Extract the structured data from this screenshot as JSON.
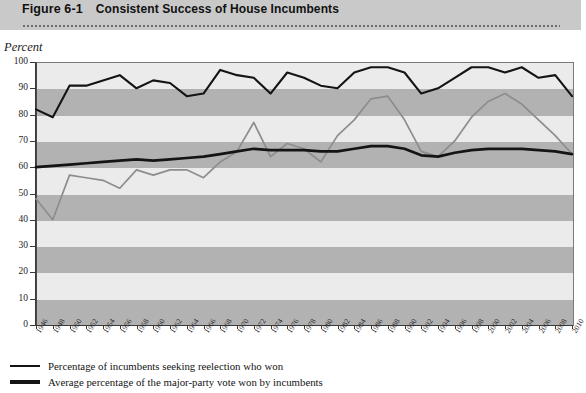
{
  "header": {
    "figure_number": "Figure 6-1",
    "title": "Consistent Success of House Incumbents"
  },
  "axis": {
    "y_axis_label": "Percent",
    "y_ticks": [
      "100",
      "90",
      "80",
      "70",
      "60",
      "50",
      "40",
      "30",
      "20",
      "10",
      "0"
    ]
  },
  "legend": {
    "items": [
      {
        "label": "Percentage of incumbents seeking reelection who won",
        "style": "thin",
        "color": "#141414"
      },
      {
        "label": "Average percentage of the major-party vote won by incumbents",
        "style": "thick",
        "color": "#141414"
      }
    ]
  },
  "chart_data": {
    "type": "line",
    "title": "Consistent Success of House Incumbents",
    "xlabel": "",
    "ylabel": "Percent",
    "ylim": [
      0,
      100
    ],
    "xlim": [
      1946,
      2010
    ],
    "grid": "horizontal alternating shaded bands every 10 percent",
    "legend_position": "below plot, left aligned",
    "categories": [
      "1946",
      "1948",
      "1950",
      "1952",
      "1954",
      "1956",
      "1958",
      "1960",
      "1962",
      "1964",
      "1966",
      "1968",
      "1970",
      "1972",
      "1974",
      "1976",
      "1978",
      "1980",
      "1982",
      "1984",
      "1986",
      "1988",
      "1990",
      "1992",
      "1994",
      "1996",
      "1998",
      "2000",
      "2002",
      "2004",
      "2006",
      "2008",
      "2010"
    ],
    "series": [
      {
        "name": "Percentage of incumbents seeking reelection who won",
        "color": "#141414",
        "values": [
          82,
          79,
          91,
          91,
          93,
          95,
          90,
          93,
          92,
          87,
          88,
          97,
          95,
          94,
          88,
          96,
          94,
          91,
          90,
          96,
          98,
          98,
          96,
          88,
          90,
          94,
          98,
          98,
          96,
          98,
          94,
          95,
          87
        ]
      },
      {
        "name": "Average percentage of the major-party vote won by incumbents",
        "color": "#141414",
        "values": [
          60,
          60.5,
          61,
          61.5,
          62,
          62.5,
          63,
          62.5,
          63,
          63.5,
          64,
          65,
          66,
          67,
          66.5,
          66.5,
          66.5,
          66,
          66,
          67,
          68,
          68,
          67,
          64.5,
          64,
          65.5,
          66.5,
          67,
          67,
          67,
          66.5,
          66,
          65
        ]
      },
      {
        "name": "Incumbent vote share trace (light)",
        "color": "#8d8d8d",
        "values": [
          48,
          40,
          57,
          56,
          55,
          52,
          59,
          57,
          59,
          59,
          56,
          62,
          66,
          77,
          64,
          69,
          67,
          62,
          72,
          78,
          86,
          87,
          78,
          66,
          64,
          70,
          79,
          85,
          88,
          84,
          78,
          72,
          65
        ]
      }
    ]
  }
}
